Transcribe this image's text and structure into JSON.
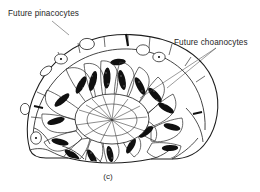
{
  "figure": {
    "caption": "(c)",
    "background_color": "#ffffff",
    "ink_color": "#1d1d1d",
    "labels": [
      {
        "id": "future-pinacocytes",
        "text": "Future pinacocytes",
        "x": 8,
        "y": 16,
        "anchor": "start",
        "leaders": [
          {
            "x1": 52,
            "y1": 21,
            "x2": 69,
            "y2": 35
          }
        ]
      },
      {
        "id": "future-choanocytes",
        "text": "Future choanocytes",
        "x": 174,
        "y": 45,
        "anchor": "start",
        "leaders": [
          {
            "x1": 216,
            "y1": 48,
            "x2": 140,
            "y2": 98
          },
          {
            "x1": 216,
            "y1": 48,
            "x2": 167,
            "y2": 88
          }
        ]
      }
    ],
    "body_outline": {
      "description": "dome shaped larva with flattened top epithelium and flared basal lobes"
    },
    "central_cavity": {
      "cx": 112,
      "cy": 118,
      "rx": 36,
      "ry": 24
    },
    "radial_cells": {
      "count": 26,
      "description": "teardrop columnar cells radiating outward from central cavity, each with dark stippled elongated nucleus",
      "nucleus_color": "#111111"
    },
    "surface_cells": {
      "count": 8,
      "description": "flattened outer pinacocyte cells with oval nuclei containing a central dot",
      "nucleus_outline_color": "#1d1d1d"
    }
  }
}
